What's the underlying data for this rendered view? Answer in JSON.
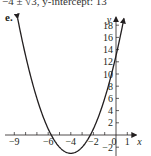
{
  "caption": "−4 ± √3, y-intercept: 13",
  "part_label": "e.",
  "chart_data": {
    "type": "line",
    "title": "",
    "function": "y = x^2 + 8x + 13",
    "series": [
      {
        "name": "parabola",
        "x": [
          -7.4,
          -7,
          -6.5,
          -6,
          -5.5,
          -5,
          -4.5,
          -4,
          -3.5,
          -3,
          -2.5,
          -2,
          -1.5,
          -1,
          -0.5,
          0,
          0.7
        ],
        "values": [
          2.56,
          -1,
          -3.75,
          -5,
          -2.75,
          -2,
          -2.75,
          -3,
          -2.75,
          -2,
          -0.75,
          1,
          3.25,
          6,
          9.25,
          13,
          18.09
        ]
      }
    ],
    "xlabel": "x",
    "ylabel": "y",
    "xlim": [
      -10,
      1.8
    ],
    "ylim": [
      -4,
      19
    ],
    "x_ticks": [
      -9,
      -8,
      -7,
      -6,
      -5,
      -4,
      -3,
      -2,
      -1,
      0,
      1
    ],
    "x_tick_labels": [
      "−9",
      "−6",
      "−4",
      "−2",
      "0",
      "1"
    ],
    "x_tick_label_values": [
      -9,
      -6,
      -4,
      -2,
      0,
      1
    ],
    "y_ticks": [
      -2,
      2,
      4,
      6,
      8,
      10,
      12,
      14,
      16,
      18
    ],
    "y_tick_labels": [
      "−2",
      "2",
      "4",
      "6",
      "8",
      "10",
      "12",
      "14",
      "16",
      "18"
    ],
    "y_tick_label_values": [
      -2,
      2,
      4,
      6,
      8,
      10,
      12,
      14,
      16,
      18
    ],
    "vertex": [
      -4,
      -3
    ],
    "roots": [
      "-4 - √3",
      "-4 + √3"
    ],
    "y_intercept": 13,
    "grid": false,
    "arrows_on_curve_ends": true
  }
}
